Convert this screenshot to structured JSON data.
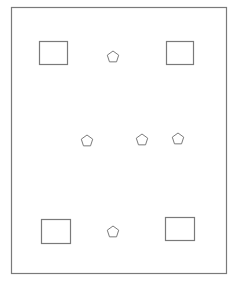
{
  "diagram": {
    "stroke_color": "#7a7a7a",
    "background": "#ffffff",
    "frame": {
      "x": 11,
      "y": 7,
      "width": 215,
      "height": 266
    },
    "rectangles": [
      {
        "id": "rect-top-left",
        "x": 39,
        "y": 41,
        "width": 28,
        "height": 23
      },
      {
        "id": "rect-top-right",
        "x": 166,
        "y": 41,
        "width": 27,
        "height": 23
      },
      {
        "id": "rect-bottom-left",
        "x": 41,
        "y": 219,
        "width": 29,
        "height": 24
      },
      {
        "id": "rect-bottom-right",
        "x": 165,
        "y": 217,
        "width": 29,
        "height": 23
      }
    ],
    "pentagons": [
      {
        "id": "pentagon-top",
        "cx": 113,
        "cy": 57,
        "r": 6
      },
      {
        "id": "pentagon-mid-left",
        "cx": 87,
        "cy": 141,
        "r": 6
      },
      {
        "id": "pentagon-mid-center",
        "cx": 142,
        "cy": 140,
        "r": 6
      },
      {
        "id": "pentagon-mid-right",
        "cx": 178,
        "cy": 139,
        "r": 6
      },
      {
        "id": "pentagon-bottom",
        "cx": 113,
        "cy": 232,
        "r": 6
      }
    ]
  }
}
